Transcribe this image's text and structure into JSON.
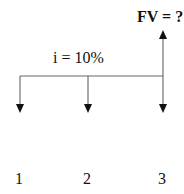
{
  "diagram": {
    "type": "cash-flow-timeline",
    "future_value_label": "FV = ?",
    "interest_rate_label": "i = 10%",
    "periods": [
      {
        "label": "1",
        "flow_direction": "down"
      },
      {
        "label": "2",
        "flow_direction": "down"
      },
      {
        "label": "3",
        "flow_direction": "down"
      }
    ],
    "future_value_flow_direction": "up",
    "colors": {
      "line": "#555555",
      "arrowhead": "#111111",
      "text": "#111111"
    }
  }
}
